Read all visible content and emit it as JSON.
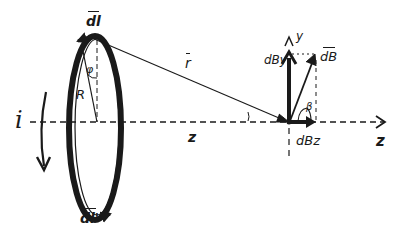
{
  "diagram": {
    "colors": {
      "ink": "#1a1a1a",
      "background": "#ffffff"
    },
    "labels": {
      "dl": "dl",
      "dl_prime": "dl'",
      "phi": "φ",
      "R": "R",
      "current": "i",
      "r_vector": "r",
      "z_distance": "z",
      "y_axis": "y",
      "z_axis": "z",
      "dB": "dB",
      "dBy": "dBy",
      "dBz": "dBz",
      "beta": "β"
    }
  }
}
